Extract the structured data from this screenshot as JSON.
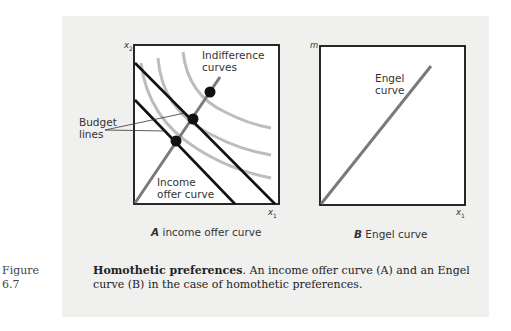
{
  "figure": {
    "number_label": "Figure",
    "number": "6.7",
    "caption_title": "Homothetic preferences",
    "caption_body": ". An income offer curve (A) and an Engel curve (B) in the case of homothetic preferences."
  },
  "panel_a": {
    "letter": "A",
    "title": "income offer curve",
    "y_axis_label": "x2",
    "x_axis_label": "x1",
    "labels": {
      "indifference_line1": "Indifference",
      "indifference_line2": "curves",
      "budget_line1": "Budget",
      "budget_line2": "lines",
      "income_line1": "Income",
      "income_line2": "offer curve"
    }
  },
  "panel_b": {
    "letter": "B",
    "title": "Engel curve",
    "y_axis_label": "m",
    "x_axis_label": "x1",
    "labels": {
      "engel_line1": "Engel",
      "engel_line2": "curve"
    }
  },
  "colors": {
    "panel_bg": "#f0f0ef",
    "curve_gray": "#7a7a7a",
    "indifference_gray": "#bdbdbd",
    "budget_black": "#111111"
  }
}
